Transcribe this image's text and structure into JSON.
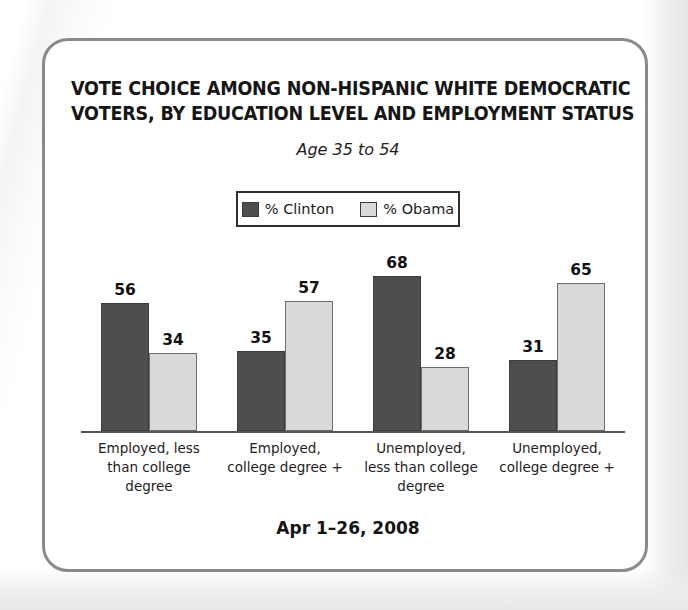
{
  "card": {
    "border_color": "#8a8a8a"
  },
  "header": {
    "title_line1": "VOTE CHOICE AMONG NON-HISPANIC WHITE DEMOCRATIC",
    "title_line2": "VOTERS, BY EDUCATION LEVEL AND EMPLOYMENT STATUS",
    "subtitle": "Age 35 to 54"
  },
  "legend": {
    "items": [
      {
        "label": "% Clinton",
        "color": "#4e4e4e",
        "swatch_name": "clinton-swatch"
      },
      {
        "label": "% Obama",
        "color": "#d9d9d9",
        "swatch_name": "obama-swatch"
      }
    ]
  },
  "footer": {
    "date_range": "Apr 1–26, 2008"
  },
  "chart_data": {
    "type": "bar",
    "title": "VOTE CHOICE AMONG NON-HISPANIC WHITE DEMOCRATIC VOTERS, BY EDUCATION LEVEL AND EMPLOYMENT STATUS",
    "subtitle": "Age 35 to 54",
    "xlabel": "",
    "ylabel": "",
    "ylim": [
      0,
      100
    ],
    "grid": false,
    "legend_position": "top-center",
    "categories": [
      "Employed, less than college degree",
      "Employed, college degree +",
      "Unemployed, less than college degree",
      "Unemployed, college degree +"
    ],
    "category_label_lines": [
      [
        "Employed, less",
        "than college",
        "degree"
      ],
      [
        "Employed,",
        "college degree +"
      ],
      [
        "Unemployed,",
        "less than college",
        "degree"
      ],
      [
        "Unemployed,",
        "college degree +"
      ]
    ],
    "series": [
      {
        "name": "% Clinton",
        "color": "#4e4e4e",
        "values": [
          56,
          35,
          68,
          31
        ]
      },
      {
        "name": "% Obama",
        "color": "#d9d9d9",
        "values": [
          34,
          57,
          28,
          65
        ]
      }
    ],
    "annotations": "Apr 1–26, 2008"
  }
}
